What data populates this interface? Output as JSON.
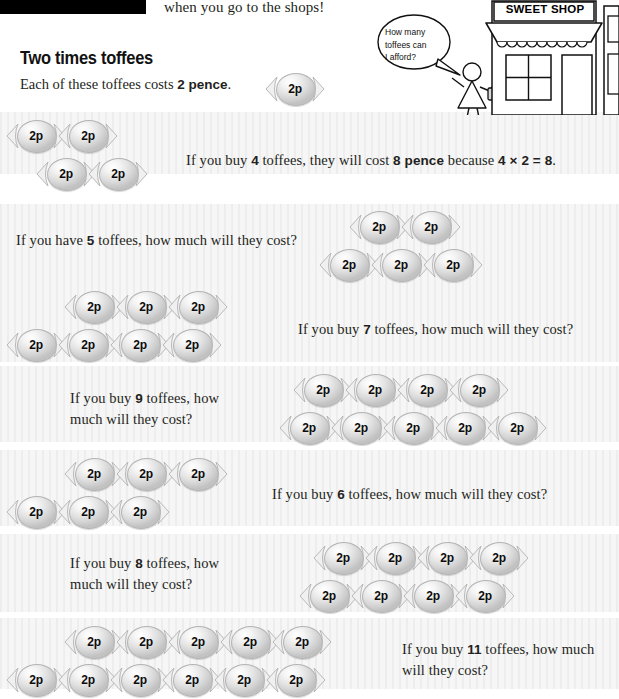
{
  "header": {
    "redaction_bar": "",
    "intro_text": "when you go to the shops!",
    "heading": "Two times toffees",
    "lede_prefix": "Each of  these toffees costs ",
    "lede_amount": "2 pence",
    "lede_suffix": ".",
    "sample_coin_label": "2p"
  },
  "illustration": {
    "shop_sign": "SWEET SHOP",
    "speech_bubble_line1": "How many",
    "speech_bubble_line2": "toffees can",
    "speech_bubble_line3": "I afford?"
  },
  "toffee_label": "2p",
  "rows": [
    {
      "id": "worked-example-4",
      "count": 4,
      "layout": [
        2,
        2
      ],
      "toffees_side": "left",
      "text_kind": "statement",
      "text_prefix": "If  you buy ",
      "quantity": "4",
      "text_middle": " toffees, they will cost ",
      "answer": "8 pence",
      "text_suffix": " because ",
      "equation": "4 × 2 = 8",
      "text_end": "."
    },
    {
      "id": "question-5",
      "count": 5,
      "layout": [
        2,
        3
      ],
      "toffees_side": "right",
      "text_kind": "question",
      "text_prefix": "If  you have ",
      "quantity": "5",
      "text_suffix": " toffees, how much will they cost?"
    },
    {
      "id": "question-7",
      "count": 7,
      "layout": [
        3,
        4
      ],
      "toffees_side": "left",
      "text_kind": "question",
      "text_prefix": "If  you buy ",
      "quantity": "7",
      "text_suffix": " toffees, how much will they cost?"
    },
    {
      "id": "question-9",
      "count": 9,
      "layout": [
        4,
        5
      ],
      "toffees_side": "right",
      "text_kind": "question",
      "text_prefix": "If  you buy ",
      "quantity": "9",
      "text_suffix": " toffees, how much will they cost?"
    },
    {
      "id": "question-6",
      "count": 6,
      "layout": [
        3,
        3
      ],
      "toffees_side": "left",
      "text_kind": "question",
      "text_prefix": "If  you buy ",
      "quantity": "6",
      "text_suffix": " toffees, how much will they cost?"
    },
    {
      "id": "question-8",
      "count": 8,
      "layout": [
        4,
        4
      ],
      "toffees_side": "right",
      "text_kind": "question",
      "text_prefix": "If  you buy ",
      "quantity": "8",
      "text_suffix": " toffees, how much will they cost?"
    },
    {
      "id": "question-11",
      "count": 11,
      "layout": [
        5,
        6
      ],
      "toffees_side": "left",
      "text_kind": "question",
      "text_prefix": "If  you buy ",
      "quantity": "11",
      "text_suffix": " toffees, how much will they cost?"
    }
  ],
  "colors": {
    "band_background": "#f6f6f6",
    "text": "#241f20",
    "toffee_body": "#e2e2e2",
    "toffee_outline": "#b4b4b4",
    "redaction": "#000000"
  }
}
